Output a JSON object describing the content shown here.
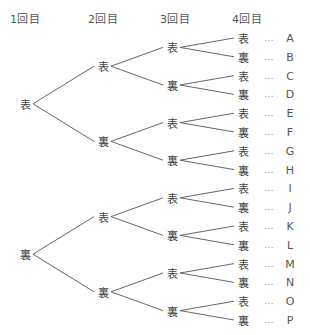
{
  "headers": [
    "1回目",
    "2回目",
    "3回目",
    "4回目"
  ],
  "symbols": {
    "heads": "表",
    "tails": "裏",
    "ellipsis": "…"
  },
  "tree": {
    "level1": [
      "表",
      "裏"
    ],
    "level2": [
      "表",
      "裏",
      "表",
      "裏"
    ],
    "level3": [
      "表",
      "裏",
      "表",
      "裏",
      "表",
      "裏",
      "表",
      "裏"
    ],
    "level4": [
      "表",
      "裏",
      "表",
      "裏",
      "表",
      "裏",
      "表",
      "裏",
      "表",
      "裏",
      "表",
      "裏",
      "表",
      "裏",
      "表",
      "裏"
    ]
  },
  "outcomes": [
    "A",
    "B",
    "C",
    "D",
    "E",
    "F",
    "G",
    "H",
    "I",
    "J",
    "K",
    "L",
    "M",
    "N",
    "O",
    "P"
  ]
}
